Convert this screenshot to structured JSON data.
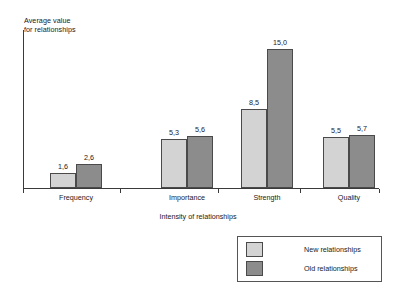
{
  "chart_data": {
    "type": "bar",
    "title": "",
    "ylabel": "Average value\nfor relationships",
    "xlabel": "Intensity of relationships",
    "categories": [
      "Frequency",
      "Importance",
      "Strength",
      "Quality"
    ],
    "series": [
      {
        "name": "New relationships",
        "color": "#d3d3d3",
        "values": [
          1.6,
          5.3,
          8.5,
          5.5
        ],
        "labels": [
          "1,6",
          "5,3",
          "8,5",
          "5,5"
        ]
      },
      {
        "name": "Old relationships",
        "color": "#8c8c8c",
        "values": [
          2.6,
          5.6,
          15.0,
          5.7
        ],
        "labels": [
          "2,6",
          "5,6",
          "15,0",
          "5,7"
        ]
      }
    ],
    "ylim": [
      0,
      17
    ],
    "grid": false,
    "legend_position": "bottom-right",
    "decimal_separator": ","
  },
  "legend": {
    "entries": [
      {
        "label": "New relationships",
        "swatch": "#d3d3d3"
      },
      {
        "label": "Old relationships",
        "swatch": "#8c8c8c"
      }
    ]
  },
  "axis": {
    "y_title": "Average value\nfor relationships",
    "x_title": "Intensity of relationships"
  }
}
